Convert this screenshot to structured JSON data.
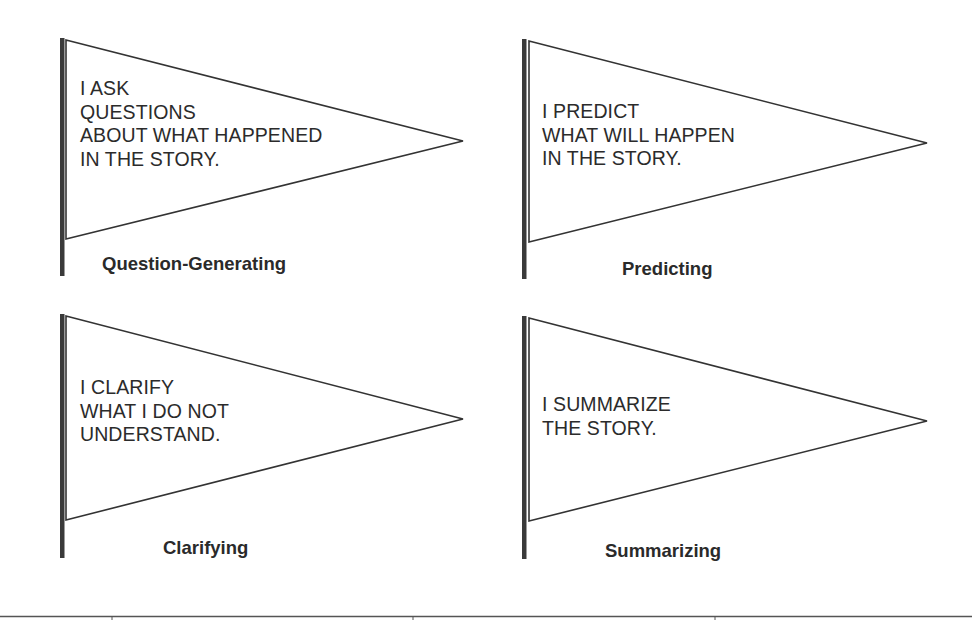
{
  "flags": [
    {
      "id": "question-generating",
      "lines": [
        "I ASK",
        "QUESTIONS",
        "ABOUT WHAT HAPPENED",
        "IN THE STORY."
      ],
      "label": "Question-Generating"
    },
    {
      "id": "predicting",
      "lines": [
        "I PREDICT",
        "WHAT WILL HAPPEN",
        "IN THE STORY."
      ],
      "label": "Predicting"
    },
    {
      "id": "clarifying",
      "lines": [
        "I CLARIFY",
        "WHAT I DO NOT",
        "UNDERSTAND."
      ],
      "label": "Clarifying"
    },
    {
      "id": "summarizing",
      "lines": [
        "I SUMMARIZE",
        "THE STORY."
      ],
      "label": "Summarizing"
    }
  ],
  "colors": {
    "pole": "#3a3a3a",
    "outline": "#333333",
    "text": "#2b2b2b"
  }
}
